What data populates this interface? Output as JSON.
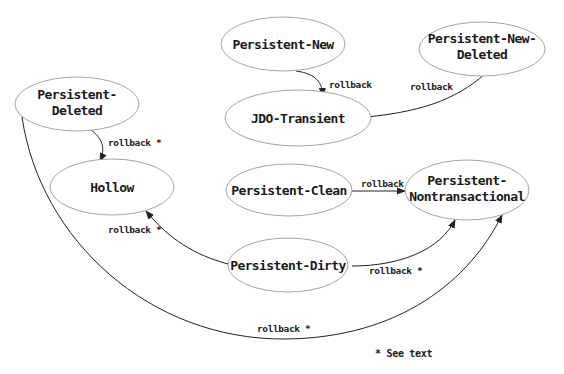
{
  "diagram": {
    "type": "state-transition",
    "nodes": [
      {
        "id": "persistent-new",
        "lines": [
          "Persistent-New"
        ]
      },
      {
        "id": "persistent-new-deleted",
        "lines": [
          "Persistent-New-",
          "Deleted"
        ]
      },
      {
        "id": "jdo-transient",
        "lines": [
          "JDO-Transient"
        ]
      },
      {
        "id": "persistent-deleted",
        "lines": [
          "Persistent-",
          "Deleted"
        ]
      },
      {
        "id": "hollow",
        "lines": [
          "Hollow"
        ]
      },
      {
        "id": "persistent-clean",
        "lines": [
          "Persistent-Clean"
        ]
      },
      {
        "id": "persistent-nontransactional",
        "lines": [
          "Persistent-",
          "Nontransactional"
        ]
      },
      {
        "id": "persistent-dirty",
        "lines": [
          "Persistent-Dirty"
        ]
      }
    ],
    "edges": [
      {
        "from": "persistent-new",
        "to": "jdo-transient",
        "label": "rollback"
      },
      {
        "from": "persistent-new-deleted",
        "to": "jdo-transient",
        "label": "rollback"
      },
      {
        "from": "persistent-deleted",
        "to": "hollow",
        "label": "rollback *"
      },
      {
        "from": "persistent-clean",
        "to": "persistent-nontransactional",
        "label": "rollback"
      },
      {
        "from": "persistent-dirty",
        "to": "hollow",
        "label": "rollback *"
      },
      {
        "from": "persistent-dirty",
        "to": "persistent-nontransactional",
        "label": "rollback *"
      },
      {
        "from": "persistent-deleted",
        "to": "persistent-nontransactional",
        "label": "rollback *"
      }
    ],
    "footnote": "* See text",
    "colors": {
      "node_stroke": "#9a9a9a",
      "edge": "#222222",
      "text": "#1a1a1a",
      "background": "#ffffff"
    }
  }
}
